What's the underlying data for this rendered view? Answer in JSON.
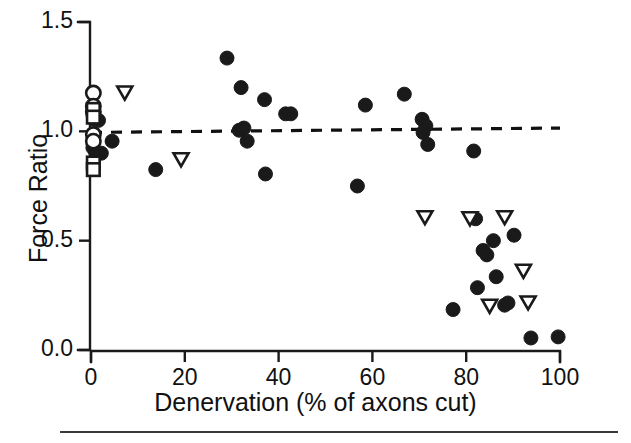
{
  "chart_data": {
    "type": "scatter",
    "title": "",
    "xlabel": "Denervation (% of axons cut)",
    "ylabel": "Force Ratio",
    "xlim": [
      0,
      100
    ],
    "ylim": [
      0.0,
      1.5
    ],
    "xticks": [
      0,
      20,
      40,
      60,
      80,
      100
    ],
    "xticklabels": [
      "0",
      "20",
      "40",
      "60",
      "80",
      "100"
    ],
    "yticks": [
      0.0,
      0.5,
      1.0,
      1.5
    ],
    "yticklabels": [
      "0.0",
      "0.5",
      "1.0",
      "1.5"
    ],
    "grid": false,
    "legend": "none",
    "reference_line": {
      "style": "dashed",
      "color": "#111111",
      "x_start": 0,
      "y_start": 0.995,
      "x_end": 100,
      "y_end": 1.015,
      "label": "unity force ratio regression"
    },
    "series": [
      {
        "name": "filled-circles",
        "marker": "filled-circle",
        "color": "#1a1a1a",
        "points": [
          [
            0.6,
            1.055
          ],
          [
            1.6,
            1.05
          ],
          [
            0.4,
            0.925
          ],
          [
            1.0,
            0.905
          ],
          [
            2.2,
            0.9
          ],
          [
            4.5,
            0.955
          ],
          [
            13.8,
            0.825
          ],
          [
            29.0,
            1.335
          ],
          [
            32.0,
            1.2
          ],
          [
            31.6,
            1.005
          ],
          [
            32.6,
            1.015
          ],
          [
            33.3,
            0.955
          ],
          [
            37.0,
            1.145
          ],
          [
            37.2,
            0.805
          ],
          [
            41.5,
            1.08
          ],
          [
            42.6,
            1.08
          ],
          [
            56.8,
            0.75
          ],
          [
            58.5,
            1.12
          ],
          [
            66.8,
            1.17
          ],
          [
            70.6,
            1.055
          ],
          [
            71.4,
            1.025
          ],
          [
            70.8,
            0.995
          ],
          [
            71.8,
            0.94
          ],
          [
            77.2,
            0.185
          ],
          [
            81.6,
            0.91
          ],
          [
            82.0,
            0.6
          ],
          [
            82.4,
            0.285
          ],
          [
            83.6,
            0.455
          ],
          [
            84.4,
            0.435
          ],
          [
            85.8,
            0.5
          ],
          [
            86.4,
            0.335
          ],
          [
            88.2,
            0.205
          ],
          [
            88.9,
            0.215
          ],
          [
            90.2,
            0.525
          ],
          [
            93.8,
            0.055
          ],
          [
            99.6,
            0.06
          ]
        ]
      },
      {
        "name": "open-circles",
        "marker": "open-circle",
        "color": "#1a1a1a",
        "points": [
          [
            0.5,
            1.175
          ],
          [
            0.5,
            1.115
          ],
          [
            0.5,
            1.09
          ],
          [
            0.5,
            0.985
          ],
          [
            0.5,
            0.955
          ]
        ]
      },
      {
        "name": "open-squares",
        "marker": "open-square",
        "color": "#1a1a1a",
        "points": [
          [
            0.5,
            1.1
          ],
          [
            0.5,
            1.065
          ],
          [
            0.5,
            0.855
          ],
          [
            0.5,
            0.825
          ]
        ]
      },
      {
        "name": "open-down-triangles",
        "marker": "open-down-triangle",
        "color": "#1a1a1a",
        "points": [
          [
            7.2,
            1.175
          ],
          [
            19.2,
            0.87
          ],
          [
            71.2,
            0.605
          ],
          [
            80.8,
            0.6
          ],
          [
            88.2,
            0.605
          ],
          [
            85.0,
            0.2
          ],
          [
            92.2,
            0.36
          ],
          [
            93.2,
            0.215
          ]
        ]
      }
    ]
  }
}
